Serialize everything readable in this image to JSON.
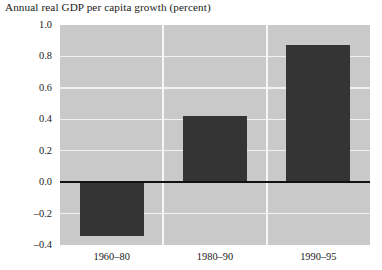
{
  "chart_data": {
    "type": "bar",
    "title": "Annual real GDP per capita growth (percent)",
    "xlabel": "",
    "ylabel": "",
    "categories": [
      "1960–80",
      "1980–90",
      "1990–95"
    ],
    "values": [
      -0.34,
      0.42,
      0.87
    ],
    "ylim": [
      -0.4,
      1.0
    ],
    "ytick_labels": [
      "1.0",
      "0.8",
      "0.6",
      "0.4",
      "0.2",
      "0.0",
      "–0.2",
      "–0.4"
    ],
    "ytick_values": [
      1.0,
      0.8,
      0.6,
      0.4,
      0.2,
      0.0,
      -0.2,
      -0.4
    ],
    "grid": true,
    "legend": null,
    "colors": {
      "bar": "#343434",
      "plot_background": "#c9c9c9",
      "gridline": "#f2f2f2",
      "panel_separator": "#f7f7f7",
      "zero_line": "#111111",
      "text": "#1a1a1a",
      "page_background": "#ffffff"
    }
  }
}
